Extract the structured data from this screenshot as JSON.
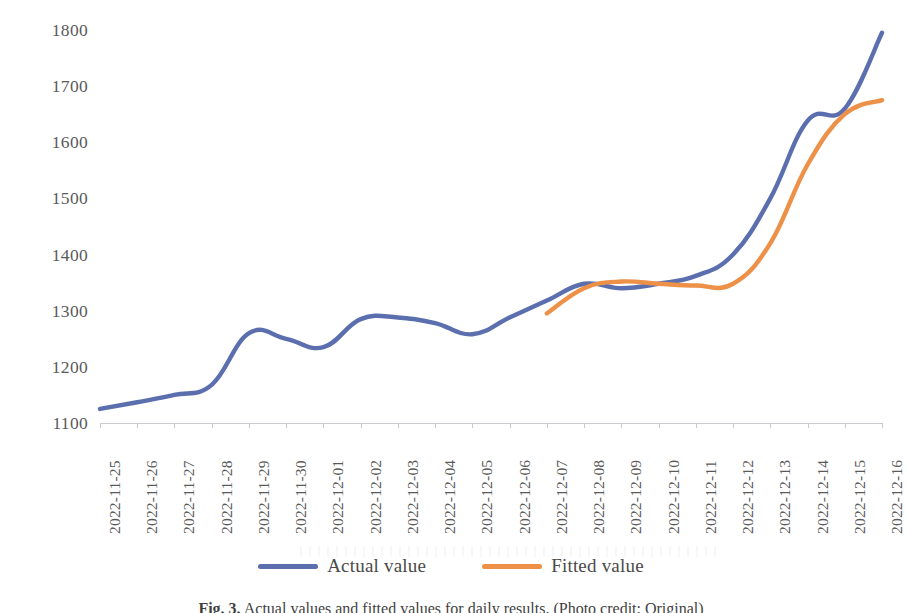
{
  "figure": {
    "caption_number": "Fig. 3.",
    "caption_text": "Actual values and fitted values for daily results. (Photo credit: Original)"
  },
  "axes": {
    "y_ticks": [
      1800,
      1700,
      1600,
      1500,
      1400,
      1300,
      1200,
      1100
    ],
    "y_min": 1100,
    "y_max": 1800,
    "x_labels": [
      "2022-11-25",
      "2022-11-26",
      "2022-11-27",
      "2022-11-28",
      "2022-11-29",
      "2022-11-30",
      "2022-12-01",
      "2022-12-02",
      "2022-12-03",
      "2022-12-04",
      "2022-12-05",
      "2022-12-06",
      "2022-12-07",
      "2022-12-08",
      "2022-12-09",
      "2022-12-10",
      "2022-12-11",
      "2022-12-12",
      "2022-12-13",
      "2022-12-14",
      "2022-12-15",
      "2022-12-16"
    ]
  },
  "legend": {
    "position": "bottom-center",
    "items": [
      {
        "label": "Actual value",
        "color": "#5b6fae",
        "icon": "line-swatch"
      },
      {
        "label": "Fitted value",
        "color": "#ed9148",
        "icon": "line-swatch"
      }
    ]
  },
  "colors": {
    "actual": "#5b6fae",
    "fitted": "#ed9148",
    "axis": "#c9c9d4",
    "tick_text": "#5a5a5a"
  },
  "chart_data": {
    "type": "line",
    "title": "",
    "xlabel": "",
    "ylabel": "",
    "ylim": [
      1100,
      1800
    ],
    "grid": false,
    "legend_position": "bottom-center",
    "x": [
      "2022-11-25",
      "2022-11-26",
      "2022-11-27",
      "2022-11-28",
      "2022-11-29",
      "2022-11-30",
      "2022-12-01",
      "2022-12-02",
      "2022-12-03",
      "2022-12-04",
      "2022-12-05",
      "2022-12-06",
      "2022-12-07",
      "2022-12-08",
      "2022-12-09",
      "2022-12-10",
      "2022-12-11",
      "2022-12-12",
      "2022-12-13",
      "2022-12-14",
      "2022-12-15",
      "2022-12-16"
    ],
    "series": [
      {
        "name": "Actual value",
        "color": "#5b6fae",
        "values": [
          1125,
          1137,
          1150,
          1168,
          1260,
          1250,
          1235,
          1285,
          1288,
          1278,
          1258,
          1288,
          1318,
          1348,
          1340,
          1348,
          1362,
          1400,
          1500,
          1638,
          1660,
          1795
        ]
      },
      {
        "name": "Fitted value",
        "color": "#ed9148",
        "values": [
          null,
          null,
          null,
          null,
          null,
          null,
          null,
          null,
          null,
          null,
          null,
          null,
          1295,
          1340,
          1352,
          1348,
          1345,
          1348,
          1420,
          1560,
          1650,
          1675
        ]
      }
    ]
  }
}
